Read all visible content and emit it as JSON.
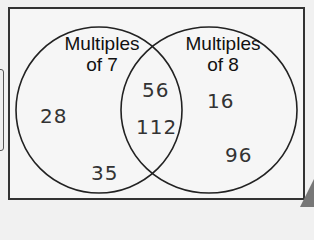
{
  "diagram": {
    "type": "venn",
    "sets": [
      {
        "label_line1": "Multiples",
        "label_line2": "of 7",
        "only": [
          "28",
          "35"
        ]
      },
      {
        "label_line1": "Multiples",
        "label_line2": "of 8",
        "only": [
          "16",
          "96"
        ]
      }
    ],
    "intersection": [
      "56",
      "112"
    ]
  }
}
